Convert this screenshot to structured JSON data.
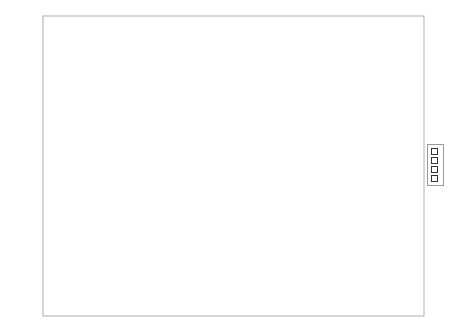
{
  "chart_data": {
    "type": "bar",
    "title": "",
    "xlabel": "",
    "ylabel": "Mean Enjoyment (Z-score)",
    "ylim": [
      -0.6,
      0.8
    ],
    "yticks": [
      "0.8",
      "0.6",
      "0.4",
      "0.2",
      "0",
      "-0.2",
      "-0.4",
      "-0.6"
    ],
    "grid": true,
    "legend_position": "right",
    "categories": [
      "Work",
      "Play",
      "Both",
      "Neither"
    ],
    "values": [
      -0.53,
      0.55,
      0.21,
      -0.12
    ],
    "colors": [
      "#8a8a8a",
      "#333333",
      "#ffffff",
      "#e6e6e6"
    ]
  },
  "legend": [
    {
      "label": "Work",
      "color": "#8a8a8a"
    },
    {
      "label": "Play",
      "color": "#333333"
    },
    {
      "label": "Both",
      "color": "#ffffff"
    },
    {
      "label": "Neither",
      "color": "#e6e6e6"
    }
  ]
}
